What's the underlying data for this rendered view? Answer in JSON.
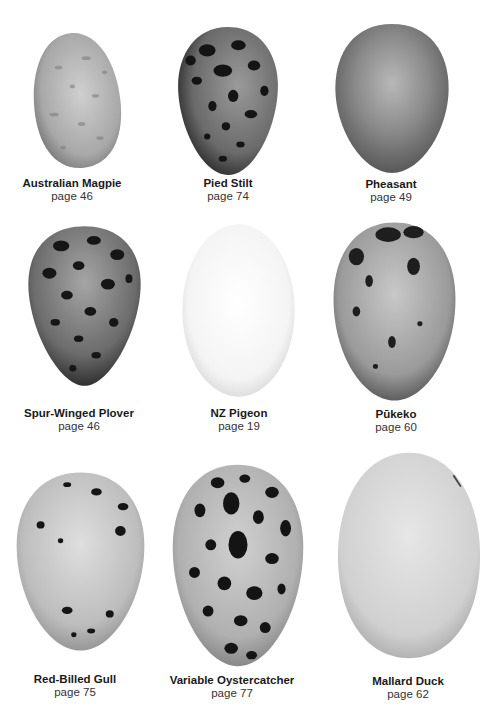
{
  "eggs": [
    {
      "name": "Australian Magpie",
      "page": "page 46"
    },
    {
      "name": "Pied Stilt",
      "page": "page 74"
    },
    {
      "name": "Pheasant",
      "page": "page 49"
    },
    {
      "name": "Spur-Winged Plover",
      "page": "page 46"
    },
    {
      "name": "NZ Pigeon",
      "page": "page 19"
    },
    {
      "name": "Pūkeko",
      "page": "page 60"
    },
    {
      "name": "Red-Billed Gull",
      "page": "page 75"
    },
    {
      "name": "Variable Oystercatcher",
      "page": "page 77"
    },
    {
      "name": "Mallard Duck",
      "page": "page 62"
    }
  ]
}
